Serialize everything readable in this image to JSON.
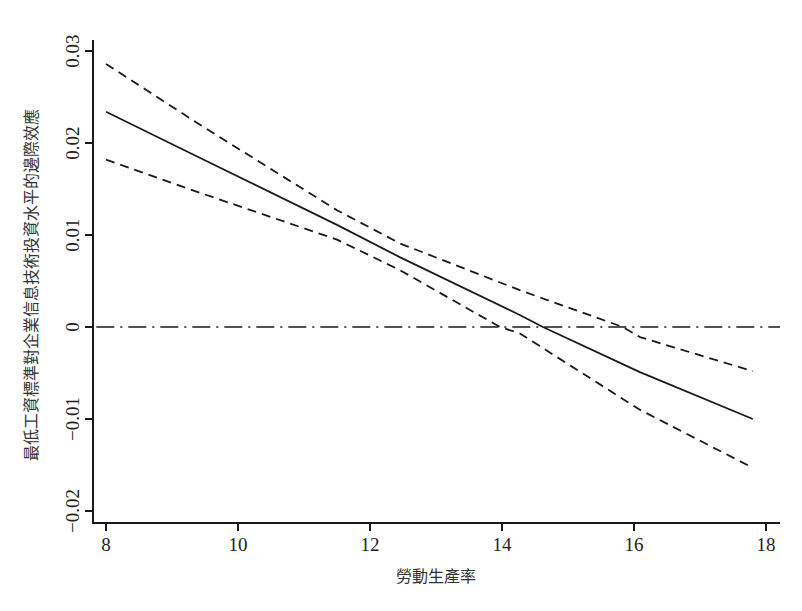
{
  "chart_data": {
    "type": "line",
    "title": "",
    "xlabel": "勞動生產率",
    "ylabel": "最低工資標準對企業信息技術投資水平的邊際效應",
    "xlim": [
      8,
      18
    ],
    "ylim": [
      -0.02,
      0.03
    ],
    "xticks": [
      8,
      10,
      12,
      14,
      16,
      18
    ],
    "xtick_labels": [
      "8",
      "10",
      "12",
      "14",
      "16",
      "18"
    ],
    "yticks": [
      -0.02,
      -0.01,
      0,
      0.01,
      0.02,
      0.03
    ],
    "ytick_labels": [
      "-0.02",
      "-0.01",
      "0",
      "0.01",
      "0.02",
      "0.03"
    ],
    "grid": false,
    "legend": null,
    "series": [
      {
        "name": "marginal effect",
        "style": "solid",
        "x": [
          8,
          9.42,
          11.5,
          12.45,
          14.27,
          14.62,
          16.09,
          17.8
        ],
        "values": [
          0.0234,
          0.0184,
          0.0111,
          0.0076,
          0.0013,
          0.0,
          -0.0049,
          -0.01
        ]
      },
      {
        "name": "upper 95% CI",
        "style": "dashed",
        "x": [
          8,
          9.42,
          11.5,
          12.45,
          14.27,
          15.83,
          16.09,
          17.8
        ],
        "values": [
          0.0286,
          0.022,
          0.0127,
          0.0091,
          0.004,
          0.0,
          -0.0011,
          -0.0048
        ]
      },
      {
        "name": "lower 95% CI",
        "style": "dashed",
        "x": [
          8,
          9.42,
          11.5,
          12.45,
          13.97,
          14.27,
          16.09,
          17.8
        ],
        "values": [
          0.0182,
          0.0146,
          0.0095,
          0.0062,
          0.0,
          -0.0007,
          -0.009,
          -0.0153
        ]
      },
      {
        "name": "zero reference",
        "style": "dashdot",
        "x": [
          7.8,
          18.2
        ],
        "values": [
          0,
          0
        ]
      }
    ]
  },
  "layout": {
    "x_px_at_8": 106,
    "px_per_x_unit": 66,
    "y_px_at_0": 327,
    "px_per_y_unit": 9200,
    "axis_left_px": 93,
    "axis_bottom_px": 523,
    "axis_top_px": 40,
    "axis_right_px": 780
  },
  "colors": {
    "line": "#1a1a1a",
    "axis": "#1a1a1a",
    "text": "#222222"
  }
}
